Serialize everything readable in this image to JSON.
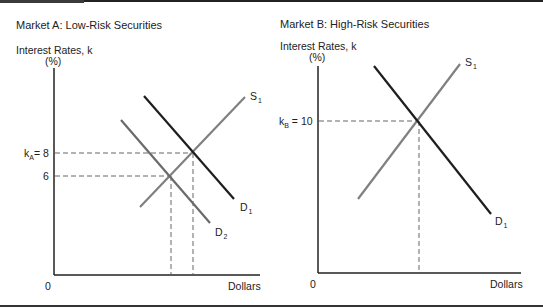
{
  "panels": [
    {
      "title": "Market A: Low-Risk Securities",
      "y_axis_label": "Interest Rates, k",
      "y_axis_unit": "(%)",
      "x_axis_label": "Dollars",
      "origin_label": "0",
      "ticks": [
        {
          "prefix": "k",
          "sub": "A",
          "text": "= 8"
        },
        {
          "prefix": "",
          "sub": "",
          "text": "6"
        }
      ],
      "curves": [
        {
          "name": "S",
          "sub": "1"
        },
        {
          "name": "D",
          "sub": "1"
        },
        {
          "name": "D",
          "sub": "2"
        }
      ]
    },
    {
      "title": "Market B: High-Risk Securities",
      "y_axis_label": "Interest Rates, k",
      "y_axis_unit": "(%)",
      "x_axis_label": "Dollars",
      "origin_label": "0",
      "ticks": [
        {
          "prefix": "k",
          "sub": "B",
          "text": " = 10"
        }
      ],
      "curves": [
        {
          "name": "S",
          "sub": "1"
        },
        {
          "name": "D",
          "sub": "1"
        }
      ]
    }
  ],
  "colors": {
    "demand": "#1e1e1e",
    "supply": "#808080",
    "axis": "#222222",
    "dashed": "#555555"
  }
}
